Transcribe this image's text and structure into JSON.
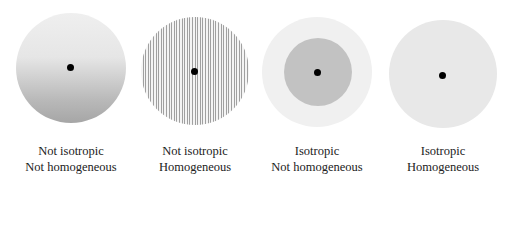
{
  "panels": [
    {
      "id": "not-iso-not-homog",
      "line1": "Not isotropic",
      "line2": "Not homogeneous",
      "fill": "vertical-gradient",
      "colors": [
        "#ececec",
        "#a9a9a9"
      ]
    },
    {
      "id": "not-iso-homog",
      "line1": "Not isotropic",
      "line2": "Homogeneous",
      "fill": "vertical-stripes",
      "colors": [
        "#f2f2f2",
        "#9a9a9a"
      ]
    },
    {
      "id": "iso-not-homog",
      "line1": "Isotropic",
      "line2": "Not homogeneous",
      "fill": "radial-two-zone",
      "colors": [
        "#eeeeee",
        "#bdbdbd"
      ]
    },
    {
      "id": "iso-homog",
      "line1": "Isotropic",
      "line2": "Homogeneous",
      "fill": "uniform",
      "colors": [
        "#e6e6e6"
      ]
    }
  ]
}
